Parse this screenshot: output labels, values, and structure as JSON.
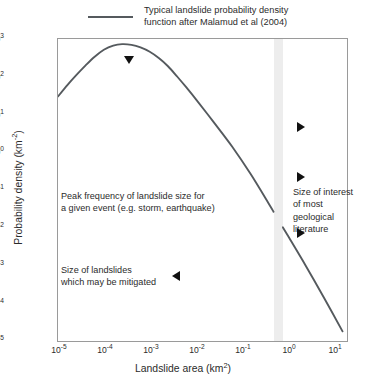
{
  "legend": {
    "line_color": "#555a5e",
    "label_line1": "Typical landslide probability density",
    "label_line2": "function after Malamud et al (2004)"
  },
  "axes": {
    "xlabel_text": "Landslide area (km",
    "xlabel_sup": "2",
    "xlabel_close": ")",
    "ylabel_text": "Probability density (km",
    "ylabel_sup": "-2",
    "ylabel_close": ")",
    "x_ticks": [
      "-5",
      "-4",
      "-3",
      "-2",
      "-1",
      "0",
      "1"
    ],
    "y_ticks": [
      "3",
      "2",
      "1",
      "0",
      "-1",
      "-2",
      "-3",
      "-4",
      "-5"
    ],
    "tick_base": "10"
  },
  "annotations": {
    "peak": "Peak frequency of landslide size for\na given event (e.g. storm, earthquake)",
    "mitigated": "Size of landslides\nwhich may be mitigated",
    "geological": "Size of interest\nof most geological\nliterature"
  },
  "markers": {
    "peak_marker": "triangle-down",
    "mitigated_marker": "triangle-left",
    "geological_marker_1": "triangle-right",
    "geological_marker_2": "triangle-right",
    "geological_marker_3": "triangle-right"
  },
  "band": {
    "fill_color": "#ededed",
    "x_start": 0.5,
    "x_end": 0.8
  },
  "chart_data": {
    "type": "line",
    "title": "",
    "xlabel": "Landslide area (km^2)",
    "ylabel": "Probability density (km^-2)",
    "xscale": "log",
    "yscale": "log",
    "xlim": [
      1e-05,
      20.0
    ],
    "ylim": [
      1e-05,
      1000.0
    ],
    "grid": false,
    "legend_position": "top",
    "series": [
      {
        "name": "Typical landslide probability density function after Malamud et al (2004)",
        "color": "#555a5e",
        "x": [
          1e-05,
          1.6e-05,
          2.5e-05,
          4e-05,
          6.3e-05,
          0.0001,
          0.00016,
          0.00025,
          0.0004,
          0.00063,
          0.001,
          0.0016,
          0.0025,
          0.004,
          0.0063,
          0.01,
          0.025,
          0.063,
          0.16,
          0.4,
          1.0,
          2.5,
          6.3,
          16.0
        ],
        "y": [
          30.0,
          60.0,
          110.0,
          200.0,
          340.0,
          520.0,
          670.0,
          730.0,
          700.0,
          600.0,
          460.0,
          310.0,
          190.0,
          100.0,
          52.0,
          26.0,
          6.2,
          1.4,
          0.26,
          0.042,
          0.0065,
          0.001,
          0.00014,
          1.8e-05
        ]
      }
    ],
    "shaded_band": {
      "label": "Size of interest of most geological literature",
      "x_start": 0.5,
      "x_end": 0.8,
      "color": "#ededed"
    },
    "annotations": [
      {
        "text": "Peak frequency of landslide size for a given event (e.g. storm, earthquake)",
        "x": 0.0004,
        "y": 730.0
      },
      {
        "text": "Size of landslides which may be mitigated",
        "x": 0.003,
        "y": 0.001
      },
      {
        "text": "Size of interest of most geological literature",
        "x": 2.0,
        "y": 0.1
      }
    ]
  }
}
